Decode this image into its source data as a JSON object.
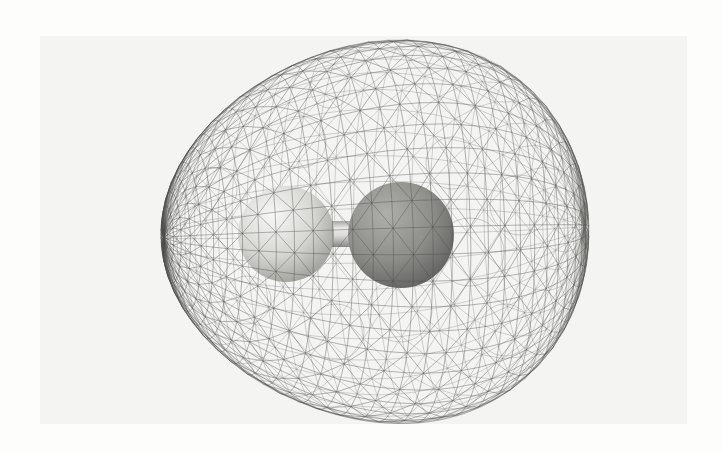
{
  "figure": {
    "page_background": "#fdfdfc",
    "panel": {
      "color": "#f4f4f2",
      "x": 40,
      "y": 36,
      "width": 647,
      "height": 388
    },
    "mesh": {
      "stroke_color_front": "#4d4d4b",
      "stroke_color_back": "#6e6e6c",
      "front_opacity": 0.58,
      "back_opacity": 0.42,
      "stroke_width": 0.7,
      "outline_opacity": 0.45,
      "center": {
        "x": 374,
        "y": 232
      },
      "axial_radius": 215,
      "vertical_radius": 190,
      "egg_factor": 0.13,
      "yaw_deg": 12,
      "pitch_deg": 7,
      "rings": 34,
      "meridians": 44,
      "circles": [
        {
          "cx": 400,
          "cy": 310,
          "r": 32
        },
        {
          "cx": 452,
          "cy": 163,
          "r": 26
        },
        {
          "cx": 470,
          "cy": 252,
          "r": 34
        },
        {
          "cx": 300,
          "cy": 142,
          "r": 26
        },
        {
          "cx": 336,
          "cy": 332,
          "r": 28
        },
        {
          "cx": 247,
          "cy": 300,
          "r": 24
        },
        {
          "cx": 505,
          "cy": 330,
          "r": 26
        },
        {
          "cx": 520,
          "cy": 205,
          "r": 30
        },
        {
          "cx": 330,
          "cy": 88,
          "r": 20
        },
        {
          "cx": 215,
          "cy": 190,
          "r": 22
        }
      ]
    },
    "atoms": [
      {
        "name": "small-light-atom",
        "cx": 286,
        "cy": 234,
        "r": 48,
        "highlight": "#f7f7f5",
        "mid": "#d6d6d3",
        "shadow": "#9a9a96"
      },
      {
        "name": "large-dark-atom",
        "cx": 401,
        "cy": 235,
        "r": 53,
        "highlight": "#aeaeab",
        "mid": "#8e8e8b",
        "shadow": "#5f5f5d"
      }
    ],
    "bond": {
      "x1": 298,
      "x2": 362,
      "cy": 234,
      "half_width": 13,
      "edge_top": "#a5a5a3",
      "bright": "#e9e9e7",
      "mid": "#dddcda",
      "edge_bottom": "#878785"
    }
  }
}
